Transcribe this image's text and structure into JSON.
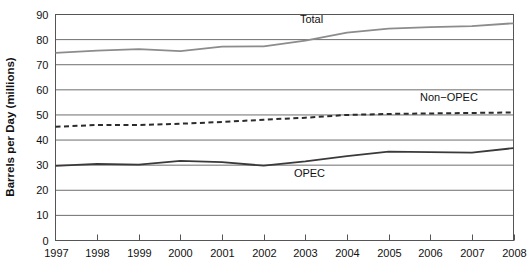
{
  "chart_data": {
    "type": "line",
    "title": "",
    "xlabel": "",
    "ylabel": "Barrels per Day (millions)",
    "x": [
      1997,
      1998,
      1999,
      2000,
      2001,
      2002,
      2003,
      2004,
      2005,
      2006,
      2007,
      2008
    ],
    "xtick_labels": [
      "1997",
      "1998",
      "1999",
      "2000",
      "2001",
      "2002",
      "2003",
      "2004",
      "2005",
      "2006",
      "2007",
      "2008"
    ],
    "ytick_labels": [
      "0",
      "10",
      "20",
      "30",
      "40",
      "50",
      "60",
      "70",
      "80",
      "90"
    ],
    "yticks": [
      0,
      10,
      20,
      30,
      40,
      50,
      60,
      70,
      80,
      90
    ],
    "ylim": [
      0,
      90
    ],
    "xlim": [
      1997,
      2008
    ],
    "grid": true,
    "legend_position": "inline-annotations",
    "series": [
      {
        "name": "Total",
        "style": "solid",
        "color": "#8c8c8c",
        "label_x": 2003.15,
        "label_y": 86.5,
        "values": [
          74.7,
          75.6,
          76.2,
          75.4,
          77.2,
          77.3,
          79.6,
          82.8,
          84.4,
          85.0,
          85.4,
          86.5
        ]
      },
      {
        "name": "Non−OPEC",
        "style": "dashed",
        "color": "#2b2b2b",
        "label_x": 2006.45,
        "label_y": 55.6,
        "values": [
          45.3,
          46.0,
          46.0,
          46.5,
          47.2,
          48.1,
          48.9,
          50.0,
          50.4,
          50.6,
          50.8,
          51.0
        ]
      },
      {
        "name": "OPEC",
        "style": "solid",
        "color": "#3a3a3a",
        "label_x": 2003.1,
        "label_y": 25.3,
        "values": [
          29.7,
          30.5,
          30.2,
          31.7,
          31.2,
          29.8,
          31.5,
          33.6,
          35.4,
          35.2,
          35.0,
          36.8
        ]
      }
    ]
  },
  "colors": {
    "total_line": "#8c8c8c",
    "nonopec_line": "#2b2b2b",
    "opec_line": "#3a3a3a",
    "gridline": "#6e6e6e",
    "frame": "#555555",
    "background": "#ffffff",
    "text": "#111111"
  }
}
